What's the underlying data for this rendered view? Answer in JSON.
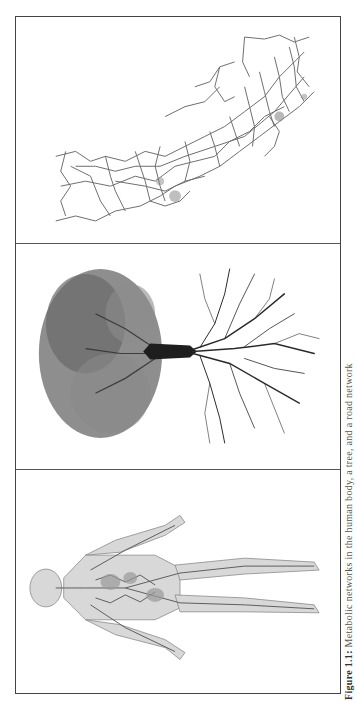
{
  "figure": {
    "orientation": "rotated-90",
    "panels": [
      {
        "id": "road-map",
        "description": "Road network map (coastal region)",
        "stroke_color": "#6e6e6e"
      },
      {
        "id": "tree",
        "description": "Tree with crown and root system",
        "foliage_color": "#7a7a7a",
        "trunk_color": "#1e1e1e"
      },
      {
        "id": "human-body",
        "description": "Human circulatory/vascular system",
        "vessel_color": "#6a6a6a"
      }
    ],
    "frame_color": "#444444",
    "caption": {
      "label": "Figure 1.1:",
      "text": "Metabolic networks in the human body, a tree, and a road network"
    }
  }
}
